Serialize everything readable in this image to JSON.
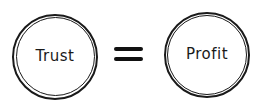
{
  "diagram": {
    "left": {
      "label": "Trust"
    },
    "operator": "=",
    "right": {
      "label": "Profit"
    }
  }
}
